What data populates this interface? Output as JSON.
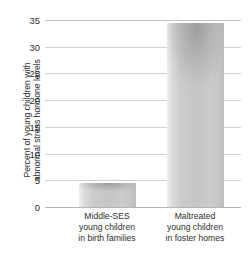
{
  "chart_data": {
    "type": "bar",
    "title": "",
    "xlabel": "",
    "ylabel": "Percent of young children with abnormal stress hormone levels",
    "ylabel_lines": [
      "Percent of young children with",
      "abnormal stress hormone levels"
    ],
    "categories": [
      "Middle-SES young children in birth families",
      "Maltreated young children in foster homes"
    ],
    "category_lines": [
      [
        "Middle-SES",
        "young children",
        "in birth families"
      ],
      [
        "Maltreated",
        "young children",
        "in foster homes"
      ]
    ],
    "values": [
      4.5,
      34.5
    ],
    "ylim": [
      0,
      35
    ],
    "yticks": [
      0,
      5,
      10,
      15,
      20,
      25,
      30,
      35
    ],
    "ytick_labels": [
      "0",
      "5",
      "10",
      "15",
      "20",
      "25",
      "30",
      "35"
    ],
    "grid": true,
    "legend": false,
    "bar_color": "#c6c6c6",
    "gridline_color": "#d2d2d2",
    "text_color": "#2e2e2e",
    "background_color": "#ffffff"
  }
}
